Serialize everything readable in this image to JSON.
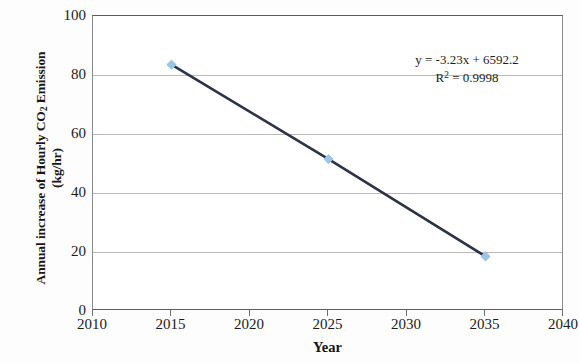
{
  "chart_data": {
    "type": "line",
    "title": "",
    "xlabel": "Year",
    "ylabel_line1": "Annual increase of Hourly CO2 Emission",
    "ylabel_line2": "(kg/hr)",
    "x": [
      2015,
      2025,
      2035
    ],
    "values": [
      83.5,
      51.5,
      18.5
    ],
    "series": [
      {
        "name": "Annual increase of Hourly CO2 Emission",
        "x": [
          2015,
          2025,
          2035
        ],
        "values": [
          83.5,
          51.5,
          18.5
        ]
      }
    ],
    "xlim": [
      2010,
      2040
    ],
    "ylim": [
      0,
      100
    ],
    "xticks": [
      2010,
      2015,
      2020,
      2025,
      2030,
      2035,
      2040
    ],
    "yticks": [
      0,
      20,
      40,
      60,
      80,
      100
    ],
    "xtick_labels": [
      "2010",
      "2015",
      "2020",
      "2025",
      "2030",
      "2035",
      "2040"
    ],
    "ytick_labels": [
      "0",
      "20",
      "40",
      "60",
      "80",
      "100"
    ],
    "grid": "horizontal",
    "legend": "none",
    "annotations": [
      "y = -3.23x + 6592.2",
      "R² = 0.9998"
    ],
    "trendline": {
      "slope": -3.23,
      "intercept": 6592.2,
      "r_squared": 0.9998,
      "equation_text": "y = -3.23x + 6592.2",
      "r2_text": "R² = 0.9998"
    },
    "colors": {
      "line": "#2c3347",
      "marker": "#9dc3e6",
      "grid": "#b9b9b9",
      "axis": "#5d5d5d",
      "text": "#1b1b1b",
      "background": "#ffffff"
    }
  },
  "axis": {
    "x_title": "Year",
    "y_title_line1_pre": "Annual increase of Hourly CO",
    "y_title_line1_sub": "2",
    "y_title_line1_post": " Emission",
    "y_title_line2": "(kg/hr)"
  },
  "annotation": {
    "equation": "y = -3.23x + 6592.2",
    "r_squared_pre": "R",
    "r_squared_sup": "2",
    "r_squared_post": " = 0.9998"
  }
}
